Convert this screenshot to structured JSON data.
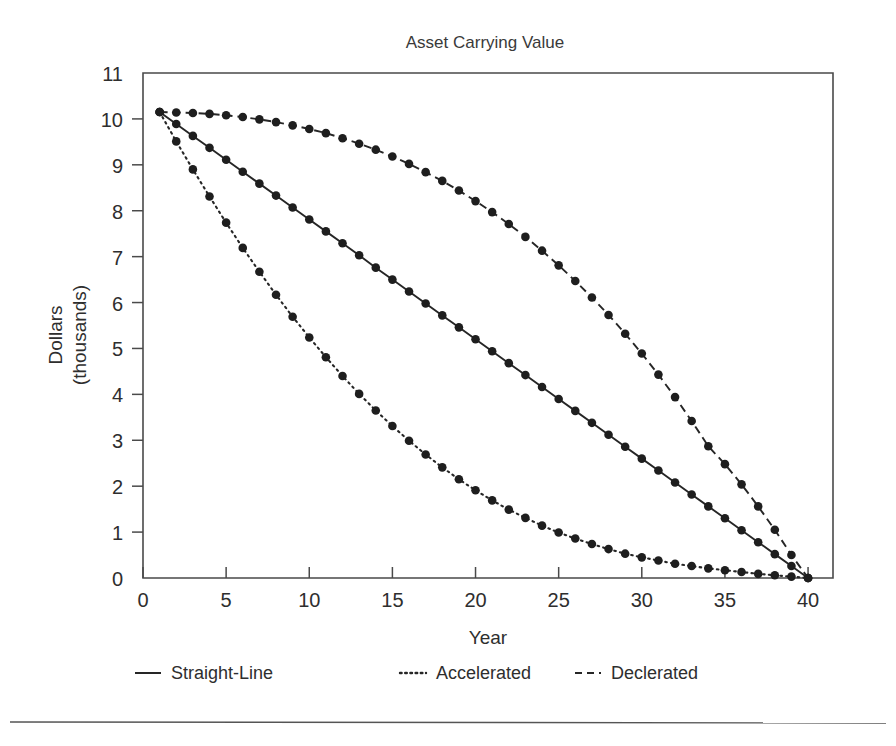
{
  "chart_data": {
    "type": "line",
    "title": "Asset Carrying Value",
    "xlabel": "Year",
    "ylabel_line1": "Dollars",
    "ylabel_line2": "(thousands)",
    "xlim": [
      0,
      41.5
    ],
    "ylim": [
      0,
      11
    ],
    "xticks": [
      0,
      5,
      10,
      15,
      20,
      25,
      30,
      35,
      40
    ],
    "yticks": [
      0,
      1,
      2,
      3,
      4,
      5,
      6,
      7,
      8,
      9,
      10,
      11
    ],
    "xtick_labels": [
      "0",
      "5",
      "10",
      "15",
      "20",
      "25",
      "30",
      "35",
      "40"
    ],
    "ytick_labels": [
      "0",
      "1",
      "2",
      "3",
      "4",
      "5",
      "6",
      "7",
      "8",
      "9",
      "10",
      "11"
    ],
    "grid": false,
    "legend_position": "below",
    "marker": "filled-circle",
    "line_color": "#262626",
    "x": [
      1,
      2,
      3,
      4,
      5,
      6,
      7,
      8,
      9,
      10,
      11,
      12,
      13,
      14,
      15,
      16,
      17,
      18,
      19,
      20,
      21,
      22,
      23,
      24,
      25,
      26,
      27,
      28,
      29,
      30,
      31,
      32,
      33,
      34,
      35,
      36,
      37,
      38,
      39,
      40
    ],
    "series": [
      {
        "name": "Straight-Line",
        "style": "solid",
        "values": [
          10.15,
          9.89,
          9.63,
          9.37,
          9.11,
          8.85,
          8.59,
          8.33,
          8.07,
          7.81,
          7.55,
          7.29,
          7.03,
          6.76,
          6.5,
          6.24,
          5.98,
          5.72,
          5.46,
          5.2,
          4.94,
          4.68,
          4.42,
          4.16,
          3.9,
          3.64,
          3.38,
          3.12,
          2.86,
          2.6,
          2.34,
          2.08,
          1.82,
          1.56,
          1.3,
          1.04,
          0.78,
          0.52,
          0.26,
          0.0
        ]
      },
      {
        "name": "Accelerated",
        "style": "dotted",
        "values": [
          10.15,
          9.51,
          8.9,
          8.31,
          7.74,
          7.19,
          6.67,
          6.17,
          5.69,
          5.24,
          4.81,
          4.4,
          4.01,
          3.65,
          3.31,
          2.99,
          2.69,
          2.41,
          2.15,
          1.91,
          1.69,
          1.49,
          1.31,
          1.14,
          0.99,
          0.86,
          0.74,
          0.63,
          0.53,
          0.45,
          0.38,
          0.31,
          0.26,
          0.21,
          0.17,
          0.13,
          0.09,
          0.06,
          0.03,
          0.0
        ]
      },
      {
        "name": "Declerated",
        "style": "dashed",
        "values": [
          10.15,
          10.14,
          10.13,
          10.11,
          10.08,
          10.04,
          9.99,
          9.93,
          9.86,
          9.78,
          9.69,
          9.58,
          9.46,
          9.33,
          9.18,
          9.02,
          8.84,
          8.65,
          8.44,
          8.21,
          7.97,
          7.71,
          7.43,
          7.13,
          6.81,
          6.47,
          6.11,
          5.73,
          5.32,
          4.89,
          4.43,
          3.94,
          3.42,
          2.87,
          2.48,
          2.04,
          1.56,
          1.05,
          0.5,
          0.0
        ]
      }
    ]
  },
  "legend": {
    "items": [
      {
        "label": "Straight-Line",
        "style": "solid"
      },
      {
        "label": "Accelerated",
        "style": "dotted"
      },
      {
        "label": "Declerated",
        "style": "dashed"
      }
    ]
  }
}
